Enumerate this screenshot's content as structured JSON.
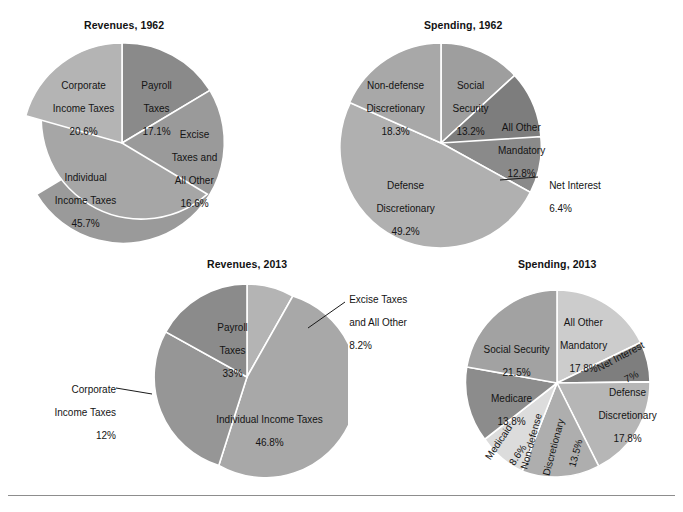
{
  "figure": {
    "background": "#ffffff",
    "rule_color": "#8d8d8d",
    "slice_border_color": "#ffffff"
  },
  "charts": [
    {
      "id": "revenues-1962",
      "title": "Revenues, 1962",
      "type": "pie",
      "labels": [
        "Payroll Taxes",
        "Excise Taxes and All Other",
        "Individual Income Taxes",
        "Corporate Income Taxes"
      ],
      "values": [
        17.1,
        16.6,
        45.7,
        20.6
      ],
      "value_texts": [
        "17.1%",
        "16.6%",
        "45.7%",
        "20.6%"
      ],
      "colors": [
        "#8a8a8a",
        "#9a9a9a",
        "#a6a6a6",
        "#b4b4b4"
      ],
      "label_lines": [
        [
          "Payroll",
          "Taxes",
          "17.1%"
        ],
        [
          "Excise",
          "Taxes and",
          "All Other",
          "16.6%"
        ],
        [
          "Individual",
          "Income Taxes",
          "45.7%"
        ],
        [
          "Corporate",
          "Income Taxes",
          "20.6%"
        ]
      ]
    },
    {
      "id": "spending-1962",
      "title": "Spending, 1962",
      "type": "pie",
      "labels": [
        "Social Security",
        "All Other Mandatory",
        "Net Interest",
        "Defense Discretionary",
        "Non-defense Discretionary"
      ],
      "values": [
        13.2,
        12.8,
        6.4,
        49.2,
        18.3
      ],
      "value_texts": [
        "13.2%",
        "12.8%",
        "6.4%",
        "49.2%",
        "18.3%"
      ],
      "colors": [
        "#9e9e9e",
        "#7d7d7d",
        "#8a8a8a",
        "#b0b0b0",
        "#a8a8a8"
      ],
      "label_lines": [
        [
          "Social",
          "Security",
          "13.2%"
        ],
        [
          "All Other",
          "Mandatory",
          "12.8%"
        ],
        [
          "Net Interest",
          "6.4%"
        ],
        [
          "Defense",
          "Discretionary",
          "49.2%"
        ],
        [
          "Non-defense",
          "Discretionary",
          "18.3%"
        ]
      ]
    },
    {
      "id": "revenues-2013",
      "title": "Revenues, 2013",
      "type": "pie",
      "labels": [
        "Excise Taxes and All Other",
        "Individual Income Taxes",
        "Corporate Income Taxes",
        "Payroll Taxes"
      ],
      "values": [
        8.2,
        46.8,
        12.0,
        33.0
      ],
      "value_texts": [
        "8.2%",
        "46.8%",
        "12%",
        "33%"
      ],
      "colors": [
        "#b4b4b4",
        "#a8a8a8",
        "#969696",
        "#8b8b8b"
      ],
      "label_lines": [
        [
          "Excise Taxes",
          "and All Other",
          "8.2%"
        ],
        [
          "Individual Income Taxes",
          "46.8%"
        ],
        [
          "Corporate",
          "Income Taxes",
          "12%"
        ],
        [
          "Payroll",
          "Taxes",
          "33%"
        ]
      ]
    },
    {
      "id": "spending-2013",
      "title": "Spending, 2013",
      "type": "pie",
      "labels": [
        "All Other Mandatory",
        "Net Interest",
        "Defense Discretionary",
        "Non-defense Discretionary",
        "Medicaid",
        "Medicare",
        "Social Security"
      ],
      "values": [
        17.8,
        7.0,
        17.8,
        13.5,
        8.6,
        13.8,
        21.5
      ],
      "value_texts": [
        "17.8%",
        "7%",
        "17.8%",
        "13.5%",
        "8.6%",
        "13.8%",
        "21.5%"
      ],
      "colors": [
        "#cccccc",
        "#7e7e7e",
        "#b6b6b6",
        "#aeaeae",
        "#dcdcdc",
        "#8c8c8c",
        "#a2a2a2"
      ],
      "label_lines": [
        [
          "All Other",
          "Mandatory",
          "17.8%"
        ],
        [
          "Net Interest",
          "7%"
        ],
        [
          "Defense",
          "Discretionary",
          "17.8%"
        ],
        [
          "Non-defense",
          "Discretionary",
          "13.5%"
        ],
        [
          "Medicaid",
          "8.6%"
        ],
        [
          "Medicare",
          "13.8%"
        ],
        [
          "Social Security",
          "21.5%"
        ]
      ]
    }
  ]
}
